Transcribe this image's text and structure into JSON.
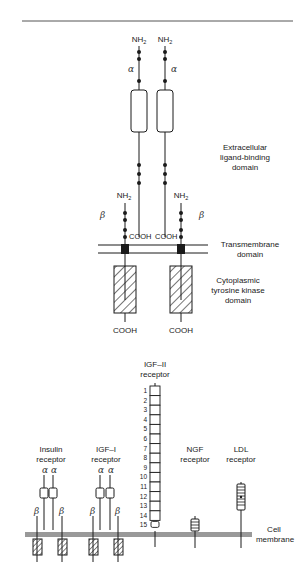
{
  "figure_top": {
    "title": "Insulin receptor structure",
    "alpha_label": "α",
    "beta_label": "β",
    "nh2": "NH",
    "nh2_sub": "2",
    "cooh": "COOH",
    "labels": {
      "extracellular_line1": "Extracellular",
      "extracellular_line2": "ligand-binding",
      "extracellular_line3": "domain",
      "transmembrane_line1": "Transmembrane",
      "transmembrane_line2": "domain",
      "cytoplasmic_line1": "Cytoplasmic",
      "cytoplasmic_line2": "tyrosine kinase",
      "cytoplasmic_line3": "domain"
    }
  },
  "figure_bottom": {
    "receptors": [
      {
        "name_line1": "Insulin",
        "name_line2": "receptor"
      },
      {
        "name_line1": "IGF–I",
        "name_line2": "receptor"
      },
      {
        "name_line1": "IGF–II",
        "name_line2": "receptor"
      },
      {
        "name_line1": "NGF",
        "name_line2": "receptor"
      },
      {
        "name_line1": "LDL",
        "name_line2": "receptor"
      }
    ],
    "igf2_repeats": [
      "1",
      "2",
      "3",
      "4",
      "5",
      "6",
      "7",
      "8",
      "9",
      "10",
      "11",
      "12",
      "13",
      "14",
      "15"
    ],
    "membrane_line1": "Cell",
    "membrane_line2": "membrane",
    "alpha_label": "α",
    "beta_label": "β"
  },
  "colors": {
    "ink": "#1a1a1a",
    "rule": "#555555",
    "hatch_fill": "#ffffff"
  }
}
